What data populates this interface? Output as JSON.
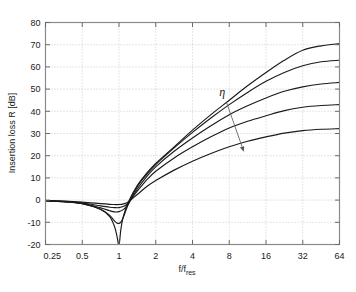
{
  "chart_data": {
    "type": "line",
    "title": "",
    "subtitle": "",
    "xlabel": "f/f_res",
    "xlabel_main": "f/f",
    "xlabel_sub": "res",
    "ylabel": "Insertion loss R [dB]",
    "xscale": "log2",
    "yscale": "linear",
    "xlim": [
      0.25,
      64
    ],
    "ylim": [
      -20,
      80
    ],
    "xticks": [
      0.25,
      0.5,
      1,
      2,
      4,
      8,
      16,
      32,
      64
    ],
    "xticklabels": [
      "0.25",
      "0.5",
      "1",
      "2",
      "4",
      "8",
      "16",
      "32",
      "64"
    ],
    "yticks": [
      -20,
      -10,
      0,
      10,
      20,
      30,
      40,
      50,
      60,
      70,
      80
    ],
    "yticklabels": [
      "-20",
      "-10",
      "0",
      "10",
      "20",
      "30",
      "40",
      "50",
      "60",
      "70",
      "80"
    ],
    "grid": true,
    "grid_style": "dotted",
    "legend": "none",
    "line_color": "#1a1a1a",
    "annotations": [
      {
        "name": "eta-arrow",
        "text": "η",
        "label_x": 7.0,
        "label_y": 47.0,
        "arrow_from_x": 7.6,
        "arrow_from_y": 44.0,
        "arrow_to_x": 10.5,
        "arrow_to_y": 22.0,
        "meaning": "increasing damping ratio eta"
      }
    ],
    "series": [
      {
        "name": "eta = 0.001",
        "eta": 0.001,
        "x": [
          0.25,
          0.354,
          0.5,
          0.707,
          0.84,
          0.92,
          0.96,
          0.99,
          1.0,
          1.01,
          1.04,
          1.09,
          1.19,
          1.41,
          1.68,
          2.0,
          2.83,
          4.0,
          5.66,
          8.0,
          11.3,
          16.0,
          22.6,
          32.0,
          45.3,
          64.0
        ],
        "y": [
          -0.3,
          -0.7,
          -1.6,
          -4.2,
          -7.4,
          -12.0,
          -16.0,
          -20.0,
          -20.0,
          -19.0,
          -12.5,
          -7.0,
          -1.0,
          6.5,
          12.0,
          16.5,
          24.0,
          31.5,
          38.5,
          45.0,
          51.5,
          57.5,
          63.0,
          67.5,
          69.5,
          70.5
        ]
      },
      {
        "name": "eta = 0.01",
        "eta": 0.01,
        "x": [
          0.25,
          0.354,
          0.5,
          0.707,
          0.84,
          0.92,
          0.96,
          1.0,
          1.04,
          1.09,
          1.19,
          1.41,
          1.68,
          2.0,
          2.83,
          4.0,
          5.66,
          8.0,
          11.3,
          16.0,
          22.6,
          32.0,
          45.3,
          64.0
        ],
        "y": [
          -0.3,
          -0.7,
          -1.6,
          -4.1,
          -6.9,
          -9.5,
          -10.3,
          -10.5,
          -9.8,
          -7.5,
          -2.0,
          6.0,
          11.5,
          16.0,
          23.5,
          30.5,
          37.0,
          43.0,
          48.5,
          53.5,
          57.5,
          60.5,
          62.3,
          63.0
        ]
      },
      {
        "name": "eta = 0.05",
        "eta": 0.05,
        "x": [
          0.25,
          0.354,
          0.5,
          0.707,
          0.84,
          0.92,
          1.0,
          1.09,
          1.19,
          1.41,
          1.68,
          2.0,
          2.83,
          4.0,
          5.66,
          8.0,
          11.3,
          16.0,
          22.6,
          32.0,
          45.3,
          64.0
        ],
        "y": [
          -0.3,
          -0.7,
          -1.5,
          -3.5,
          -4.8,
          -5.3,
          -5.2,
          -4.2,
          -1.8,
          5.0,
          10.5,
          15.0,
          22.0,
          28.0,
          33.5,
          38.5,
          42.5,
          46.0,
          49.0,
          51.0,
          52.3,
          53.0
        ]
      },
      {
        "name": "eta = 0.2",
        "eta": 0.2,
        "x": [
          0.25,
          0.354,
          0.5,
          0.707,
          0.84,
          0.92,
          1.0,
          1.09,
          1.19,
          1.41,
          1.68,
          2.0,
          2.83,
          4.0,
          5.66,
          8.0,
          11.3,
          16.0,
          22.6,
          32.0,
          45.3,
          64.0
        ],
        "y": [
          -0.25,
          -0.6,
          -1.3,
          -2.6,
          -3.2,
          -3.4,
          -3.4,
          -2.8,
          -1.3,
          4.0,
          9.0,
          13.0,
          19.0,
          24.0,
          28.5,
          32.5,
          35.5,
          38.0,
          40.3,
          41.8,
          42.6,
          43.0
        ]
      },
      {
        "name": "eta = 1.0",
        "eta": 1.0,
        "x": [
          0.25,
          0.354,
          0.5,
          0.707,
          0.84,
          0.92,
          1.0,
          1.09,
          1.19,
          1.41,
          1.68,
          2.0,
          2.83,
          4.0,
          5.66,
          8.0,
          11.3,
          16.0,
          22.6,
          32.0,
          45.3,
          64.0
        ],
        "y": [
          -0.2,
          -0.45,
          -0.9,
          -1.6,
          -1.9,
          -2.0,
          -2.0,
          -1.7,
          -0.8,
          2.5,
          6.0,
          8.8,
          13.5,
          17.5,
          21.0,
          24.0,
          26.5,
          28.5,
          30.2,
          31.3,
          31.9,
          32.2
        ]
      }
    ]
  },
  "figure": {
    "background": "#ffffff",
    "axes_color": "#808080",
    "grid_color": "#bfbfbf",
    "text_color": "#1a1a1a"
  }
}
